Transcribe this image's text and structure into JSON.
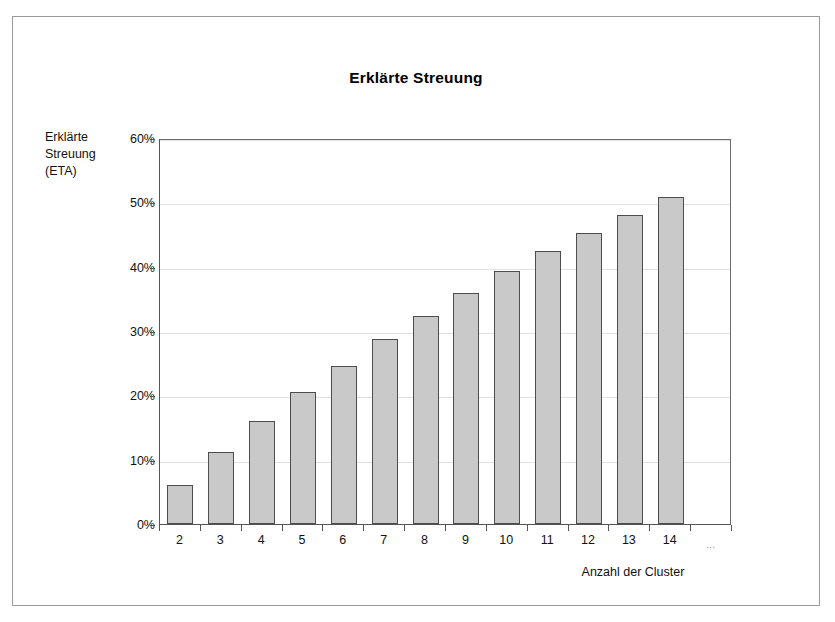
{
  "chart_data": {
    "type": "bar",
    "title": "Erklärte Streuung",
    "xlabel": "Anzahl der Cluster",
    "ylabel": "Erklärte Streuung (ETA)",
    "ylabel_lines": [
      "Erklärte",
      "Streuung",
      "(ETA)"
    ],
    "categories": [
      "2",
      "3",
      "4",
      "5",
      "6",
      "7",
      "8",
      "9",
      "10",
      "11",
      "12",
      "13",
      "14",
      "..."
    ],
    "values": [
      6.0,
      11.2,
      16.0,
      20.5,
      24.5,
      28.7,
      32.3,
      35.9,
      39.3,
      42.4,
      45.3,
      48.1,
      50.8,
      null
    ],
    "ylim": [
      0,
      60
    ],
    "ytick_labels": [
      "60%",
      "50%",
      "40%",
      "30%",
      "20%",
      "10%",
      "0%"
    ],
    "ytick_values": [
      60,
      50,
      40,
      30,
      20,
      10,
      0
    ],
    "grid": true,
    "legend": null,
    "bar_color": "#c9c9c9",
    "bar_border_color": "#4d4d4d",
    "gridline_color": "#e2e2e2",
    "axis_color": "#555555",
    "frame_color": "#9a9a9a",
    "background": "#ffffff"
  }
}
